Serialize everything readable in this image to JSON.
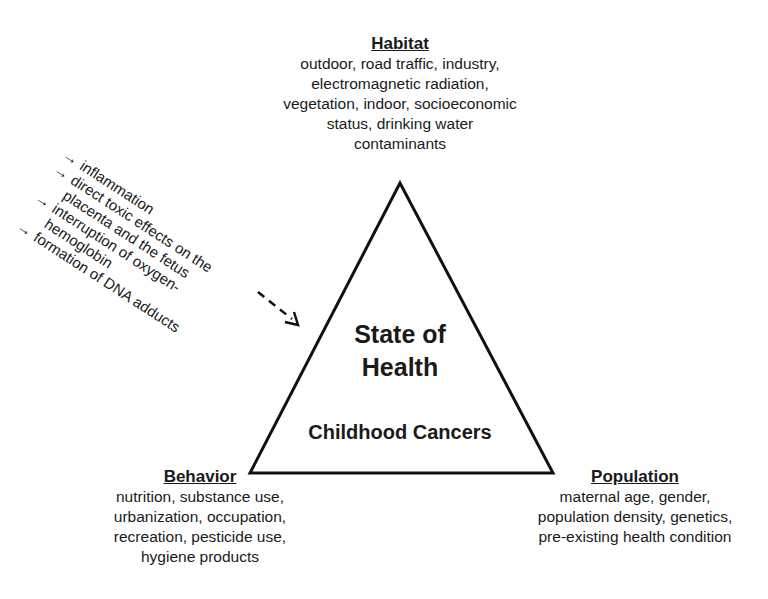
{
  "diagram": {
    "center": {
      "title_line1": "State of",
      "title_line2": "Health",
      "subtitle": "Childhood Cancers"
    },
    "habitat": {
      "heading": "Habitat",
      "lines": [
        "outdoor, road traffic, industry,",
        "electromagnetic radiation,",
        "vegetation, indoor, socioeconomic",
        "status, drinking water",
        "contaminants"
      ]
    },
    "behavior": {
      "heading": "Behavior",
      "lines": [
        "nutrition, substance use,",
        "urbanization, occupation,",
        "recreation, pesticide use,",
        "hygiene products"
      ]
    },
    "population": {
      "heading": "Population",
      "lines": [
        "maternal age, gender,",
        "population density, genetics,",
        "pre-existing health condition"
      ]
    },
    "mechanisms": {
      "bullet": "→",
      "lines": [
        {
          "text": "inflammation",
          "bullet": true
        },
        {
          "text": "direct toxic effects on the",
          "bullet": true
        },
        {
          "text": "placenta and the fetus",
          "bullet": false
        },
        {
          "text": "interruption of oxygen-",
          "bullet": true
        },
        {
          "text": "hemoglobin",
          "bullet": false
        },
        {
          "text": "formation of DNA adducts",
          "bullet": true
        }
      ]
    }
  }
}
